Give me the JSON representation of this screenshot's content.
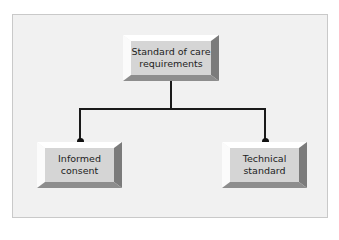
{
  "diagram": {
    "type": "hierarchy",
    "root": {
      "label": "Standard of care\nrequirements"
    },
    "children": [
      {
        "label": "Informed\nconsent"
      },
      {
        "label": "Technical\nstandard"
      }
    ],
    "colors": {
      "frame_background": "#f1f1f1",
      "box_face": "#d5d5d5",
      "bevel_light": "#ffffff",
      "bevel_dark": "#7b7b7b",
      "connector": "#1a1a1a"
    }
  }
}
